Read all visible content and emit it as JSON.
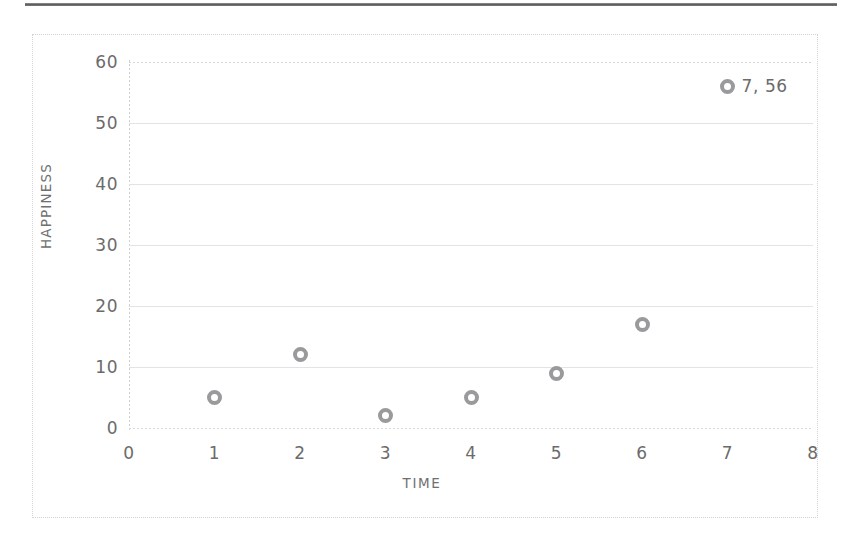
{
  "chart_data": {
    "type": "scatter",
    "title": "",
    "xlabel": "TIME",
    "ylabel": "HAPPINESS",
    "xlim": [
      0,
      8
    ],
    "ylim": [
      0,
      60
    ],
    "x_ticks": [
      "0",
      "1",
      "2",
      "3",
      "4",
      "5",
      "6",
      "7",
      "8"
    ],
    "y_ticks": [
      "60",
      "50",
      "40",
      "30",
      "20",
      "10",
      "0"
    ],
    "grid": "horizontal",
    "legend": "none",
    "marker_style": "open-circle-donut",
    "marker_color": "#9a9a9d",
    "points": [
      {
        "x": 1,
        "y": 5,
        "label": ""
      },
      {
        "x": 2,
        "y": 12,
        "label": ""
      },
      {
        "x": 3,
        "y": 2,
        "label": ""
      },
      {
        "x": 4,
        "y": 5,
        "label": ""
      },
      {
        "x": 5,
        "y": 9,
        "label": ""
      },
      {
        "x": 6,
        "y": 17,
        "label": ""
      },
      {
        "x": 7,
        "y": 56,
        "label": "7, 56"
      }
    ],
    "annotations": [
      {
        "text": "7, 56",
        "for_point": "7,56"
      }
    ]
  },
  "axis": {
    "y_title": "HAPPINESS",
    "x_title": "TIME",
    "y_tick_labels": [
      "60",
      "50",
      "40",
      "30",
      "20",
      "10",
      "0"
    ],
    "x_tick_labels": [
      "0",
      "1",
      "2",
      "3",
      "4",
      "5",
      "6",
      "7",
      "8"
    ]
  },
  "colors": {
    "marker": "#9a9a9d",
    "gridline": "#e3e3e5",
    "frame_border": "#d3d3d6",
    "text": "#6b6b6b",
    "top_rule": "#4f4f4f",
    "background": "#ffffff"
  }
}
